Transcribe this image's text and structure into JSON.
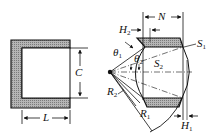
{
  "diagram": {
    "type": "engineering cross-section drawing",
    "colors": {
      "line": "#111111",
      "hatch": "#9a9a9a",
      "background": "#ffffff"
    },
    "left_figure": {
      "description": "C-shaped hatched section",
      "labels": {
        "height": "C",
        "length": "L"
      }
    },
    "right_figure": {
      "description": "curved ring segment with two hatched lands",
      "labels": {
        "N": "N",
        "H2": {
          "base": "H",
          "sub": "2"
        },
        "H1": {
          "base": "H",
          "sub": "1"
        },
        "S1": {
          "base": "S",
          "sub": "1"
        },
        "S2": {
          "base": "S",
          "sub": "2"
        },
        "R1": {
          "base": "R",
          "sub": "1"
        },
        "R2": {
          "base": "R",
          "sub": "2"
        },
        "theta1": {
          "base": "θ",
          "sub": "1"
        },
        "theta2": {
          "base": "θ",
          "sub": "2"
        }
      }
    }
  }
}
